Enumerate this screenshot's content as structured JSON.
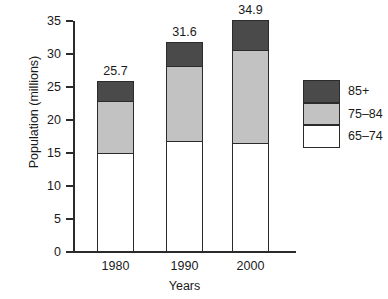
{
  "chart_data": {
    "type": "bar",
    "subtype": "stacked-bar",
    "title": "",
    "xlabel": "Years",
    "ylabel": "Population (millions)",
    "categories": [
      "1980",
      "1990",
      "2000"
    ],
    "ylim": [
      0,
      35
    ],
    "yticks": [
      0,
      5,
      10,
      15,
      20,
      25,
      30,
      35
    ],
    "ytick_labels": [
      "0",
      "5",
      "10",
      "15",
      "20",
      "25",
      "30",
      "35"
    ],
    "grid": false,
    "legend_position": "right",
    "series": [
      {
        "name": "65–74",
        "color": "#ffffff",
        "values": [
          14.8,
          16.7,
          16.3
        ]
      },
      {
        "name": "75–84",
        "color": "#c2c2c2",
        "values": [
          8.0,
          11.3,
          14.1
        ]
      },
      {
        "name": "85+",
        "color": "#4a4a4a",
        "values": [
          2.9,
          3.6,
          4.5
        ]
      }
    ],
    "totals": [
      25.7,
      31.6,
      34.9
    ],
    "total_labels": [
      "25.7",
      "31.6",
      "34.9"
    ]
  },
  "legend": {
    "items": [
      {
        "label": "85+"
      },
      {
        "label": "75–84"
      },
      {
        "label": "65–74"
      }
    ]
  }
}
